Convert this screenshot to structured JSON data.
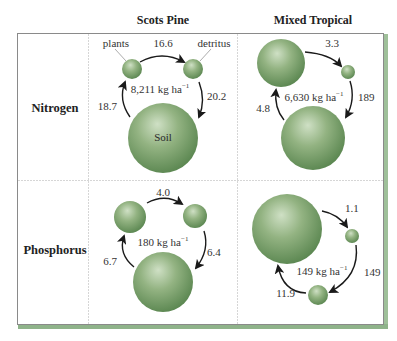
{
  "figure": {
    "column_headers": [
      "Scots Pine",
      "Mixed Tropical"
    ],
    "row_headers": [
      "Nitrogen",
      "Phosphorus"
    ],
    "colors": {
      "sphere_light": "#c9dcbf",
      "sphere_mid": "#8fb07d",
      "sphere_dark": "#5f8a52",
      "frame_shadow": "#8fb38a",
      "grid_line": "#cfcfcf",
      "arrow": "#1a1a1a"
    },
    "panels": [
      {
        "id": "scots-pine-nitrogen",
        "ecosystem": "Scots Pine",
        "nutrient": "Nitrogen",
        "pool_label": "8,211 kg ha",
        "pool_unit_sup": "−1",
        "compartment_labels": {
          "plants": "plants",
          "detritus": "detritus",
          "soil": "Soil"
        },
        "flows": {
          "plants_to_detritus": "16.6",
          "detritus_to_soil": "20.2",
          "soil_to_plants": "18.7"
        }
      },
      {
        "id": "mixed-tropical-nitrogen",
        "ecosystem": "Mixed Tropical",
        "nutrient": "Nitrogen",
        "pool_label": "6,630 kg ha",
        "pool_unit_sup": "−1",
        "flows": {
          "plants_to_detritus": "3.3",
          "detritus_to_soil": "189",
          "soil_to_plants": "4.8"
        }
      },
      {
        "id": "scots-pine-phosphorus",
        "ecosystem": "Scots Pine",
        "nutrient": "Phosphorus",
        "pool_label": "180 kg ha",
        "pool_unit_sup": "−1",
        "flows": {
          "plants_to_detritus": "4.0",
          "detritus_to_soil": "6.4",
          "soil_to_plants": "6.7"
        }
      },
      {
        "id": "mixed-tropical-phosphorus",
        "ecosystem": "Mixed Tropical",
        "nutrient": "Phosphorus",
        "pool_label": "149 kg ha",
        "pool_unit_sup": "−1",
        "flows": {
          "plants_to_detritus": "1.1",
          "detritus_to_soil": "149",
          "soil_to_plants": "11.9"
        }
      }
    ]
  }
}
